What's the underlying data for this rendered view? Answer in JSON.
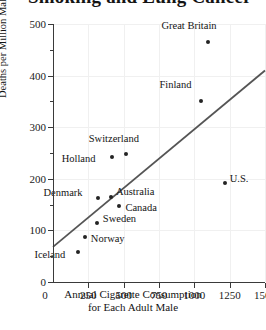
{
  "figure": {
    "cut_off_title": "Smoking and Lung Cancer",
    "background_color": "#ffffff",
    "point_color": "#242424",
    "line_color": "#555555",
    "grid_color": "#f0f0f0",
    "axis_color": "#3a3a3a"
  },
  "chart_data": {
    "type": "scatter",
    "title": "",
    "xlabel_line1": "Annual Cigarette Consumption",
    "xlabel_line2": "for Each Adult Male",
    "ylabel": "Deaths per Million Males from Lung Cancer",
    "xlim": [
      0,
      1500
    ],
    "ylim": [
      0,
      500
    ],
    "xticks": [
      0,
      250,
      500,
      750,
      1000,
      1250,
      1500
    ],
    "xticklabels": [
      "0",
      "250",
      "500",
      "750",
      "1000",
      "1250",
      "1500"
    ],
    "yticks": [
      0,
      100,
      200,
      300,
      400,
      500
    ],
    "yticklabels": [
      "0",
      "100",
      "200",
      "300",
      "400",
      "500"
    ],
    "yminorticks": [
      50,
      150,
      250,
      350,
      450
    ],
    "grid": true,
    "legend": "none",
    "points": [
      {
        "label": "Great Britain",
        "x": 1100,
        "y": 465,
        "label_dx": -47,
        "label_dy": -15
      },
      {
        "label": "Finland",
        "x": 1050,
        "y": 350,
        "label_dx": -42,
        "label_dy": -15
      },
      {
        "label": "U.S.",
        "x": 1215,
        "y": 192,
        "label_dx": 5,
        "label_dy": -3
      },
      {
        "label": "Switzerland",
        "x": 515,
        "y": 248,
        "label_dx": -37,
        "label_dy": -14
      },
      {
        "label": "Holland",
        "x": 415,
        "y": 242,
        "label_dx": -50,
        "label_dy": 3
      },
      {
        "label": "Denmark",
        "x": 315,
        "y": 162,
        "label_dx": -54,
        "label_dy": -4
      },
      {
        "label": "Australia",
        "x": 410,
        "y": 165,
        "label_dx": 5,
        "label_dy": -4
      },
      {
        "label": "Canada",
        "x": 470,
        "y": 148,
        "label_dx": 6,
        "label_dy": 3
      },
      {
        "label": "Sweden",
        "x": 310,
        "y": 115,
        "label_dx": 6,
        "label_dy": -3
      },
      {
        "label": "Norway",
        "x": 225,
        "y": 88,
        "label_dx": 6,
        "label_dy": 3
      },
      {
        "label": "Iceland",
        "x": 180,
        "y": 58,
        "label_dx": -44,
        "label_dy": 4
      }
    ],
    "trendline": {
      "label": "regression-line",
      "x_start": 0,
      "y_start": 68,
      "x_end": 1500,
      "y_end": 410
    }
  }
}
